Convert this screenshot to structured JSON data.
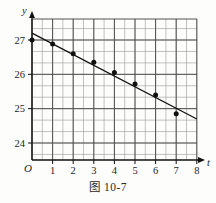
{
  "figure": {
    "caption": "图 10-7",
    "x_axis_name": "t",
    "y_axis_name": "y",
    "origin_label": "O"
  },
  "chart_data": {
    "type": "scatter",
    "title": "图 10-7",
    "xlabel": "t",
    "ylabel": "y",
    "xlim": [
      0,
      8.4
    ],
    "ylim": [
      23.6,
      27.45
    ],
    "grid": true,
    "legend": "none",
    "x_ticks": [
      1,
      2,
      3,
      4,
      5,
      6,
      7,
      8
    ],
    "x_tick_labels": [
      "1",
      "2",
      "3",
      "4",
      "5",
      "6",
      "7",
      "8"
    ],
    "y_ticks": [
      24,
      25,
      26,
      27
    ],
    "y_tick_labels": [
      "24",
      "25",
      "26",
      "27"
    ],
    "x_minor_step": 0.5,
    "y_minor_step": 0.3333,
    "series": [
      {
        "name": "observations",
        "type": "scatter",
        "marker": "filled-circle",
        "color": "#101010",
        "points": [
          {
            "x": 0,
            "y": 27.0
          },
          {
            "x": 1,
            "y": 26.88
          },
          {
            "x": 2,
            "y": 26.6
          },
          {
            "x": 3,
            "y": 26.35
          },
          {
            "x": 4,
            "y": 26.05
          },
          {
            "x": 5,
            "y": 25.72
          },
          {
            "x": 6,
            "y": 25.4
          },
          {
            "x": 7,
            "y": 24.85
          }
        ]
      },
      {
        "name": "fitted-line",
        "type": "line",
        "color": "#101010",
        "endpoints": [
          {
            "x": 0,
            "y": 27.2
          },
          {
            "x": 8,
            "y": 24.7
          }
        ]
      }
    ],
    "colors": {
      "axis": "#101010",
      "grid_major": "#4a4a4a",
      "grid_minor": "#9a9a9a",
      "marker": "#101010",
      "line": "#101010",
      "background": "#fdfdfb"
    }
  }
}
